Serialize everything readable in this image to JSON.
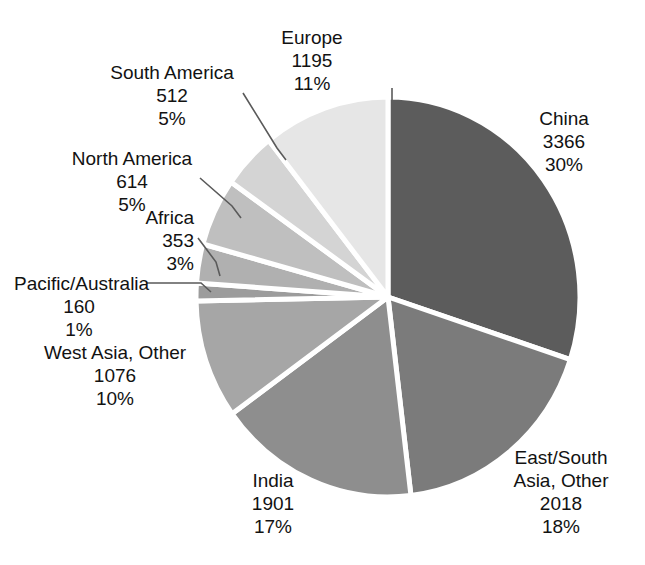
{
  "chart_data": {
    "type": "pie",
    "title": "",
    "total": 11185,
    "units": "",
    "legend_position": "callout-labels",
    "start_angle_deg": 0,
    "direction": "clockwise",
    "categories": [
      "China",
      "East/South Asia, Other",
      "India",
      "West Asia, Other",
      "Pacific/Australia",
      "Africa",
      "North America",
      "South America",
      "Europe"
    ],
    "values": [
      3366,
      2018,
      1901,
      1076,
      160,
      353,
      614,
      512,
      1195
    ],
    "percents": [
      30,
      18,
      17,
      10,
      1,
      3,
      5,
      5,
      11
    ],
    "slices": [
      {
        "name": "China",
        "value": "3366",
        "percent": "30%",
        "color": "#5c5c5c"
      },
      {
        "name": "East/South",
        "name2": "Asia, Other",
        "value": "2018",
        "percent": "18%",
        "color": "#7b7b7b"
      },
      {
        "name": "India",
        "value": "1901",
        "percent": "17%",
        "color": "#8e8e8e"
      },
      {
        "name": "West Asia, Other",
        "value": "1076",
        "percent": "10%",
        "color": "#a6a6a6"
      },
      {
        "name": "Pacific/Australia",
        "value": "160",
        "percent": "1%",
        "color": "#9c9c9c"
      },
      {
        "name": "Africa",
        "value": "353",
        "percent": "3%",
        "color": "#b0b0b0"
      },
      {
        "name": "North America",
        "value": "614",
        "percent": "5%",
        "color": "#bfbfbf"
      },
      {
        "name": "South America",
        "value": "512",
        "percent": "5%",
        "color": "#d4d4d4"
      },
      {
        "name": "Europe",
        "value": "1195",
        "percent": "11%",
        "color": "#e6e6e6"
      }
    ]
  },
  "labels": {
    "europe": {
      "name": "Europe",
      "value": "1195",
      "percent": "11%"
    },
    "south_america": {
      "name": "South America",
      "value": "512",
      "percent": "5%"
    },
    "north_america": {
      "name": "North America",
      "value": "614",
      "percent": "5%"
    },
    "africa": {
      "name": "Africa",
      "value": "353",
      "percent": "3%"
    },
    "pacific_australia": {
      "name": "Pacific/Australia",
      "value": "160",
      "percent": "1%"
    },
    "west_asia": {
      "name": "West Asia, Other",
      "value": "1076",
      "percent": "10%"
    },
    "india": {
      "name": "India",
      "value": "1901",
      "percent": "17%"
    },
    "east_south_asia": {
      "name": "East/South",
      "name2": "Asia, Other",
      "value": "2018",
      "percent": "18%"
    },
    "china": {
      "name": "China",
      "value": "3366",
      "percent": "30%"
    }
  },
  "style": {
    "background": "#ffffff",
    "text_color": "#121212",
    "separator_color": "#ffffff",
    "leader_line_color": "#5a5a5a"
  }
}
